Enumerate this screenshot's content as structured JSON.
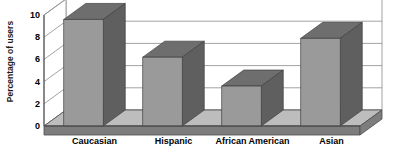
{
  "chart_data": {
    "type": "bar",
    "title": "",
    "subtitle": "",
    "xlabel": "",
    "ylabel": "Percentage of users",
    "categories": [
      "Caucasian",
      "Hispanic",
      "African American",
      "Asian"
    ],
    "values": [
      9.6,
      6.2,
      3.6,
      7.9
    ],
    "series": [
      {
        "name": "Percentage of users",
        "values": [
          9.6,
          6.2,
          3.6,
          7.9
        ]
      }
    ],
    "ylim": [
      0,
      10
    ],
    "y_ticks": [
      0,
      2,
      4,
      6,
      8,
      10
    ],
    "y_tick_labels": [
      "0",
      "2",
      "4",
      "6",
      "8",
      "10"
    ],
    "grid": true,
    "grid_axis": "y",
    "legend": false,
    "legend_position": "none",
    "style": "3d-column",
    "colors": {
      "bar_front": "#9a9a9a",
      "bar_top": "#6e6e6e",
      "bar_side": "#5f5f5f",
      "floor_top": "#bdbdbd",
      "floor_front": "#7d7d7d",
      "wall": "#ffffff",
      "grid_line": "#8a8a8a",
      "axis_line": "#4d4d4d",
      "text": "#000000",
      "background": "#ffffff"
    },
    "annotations": []
  }
}
